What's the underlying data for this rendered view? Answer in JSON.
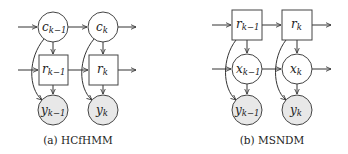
{
  "figures": [
    {
      "id": "a",
      "caption": "(a) HCfHMM",
      "nodes": [
        {
          "id": "c_km1",
          "shape": "circle",
          "var": "c",
          "sub": "k−1",
          "fill": "#ffffff"
        },
        {
          "id": "c_k",
          "shape": "circle",
          "var": "c",
          "sub": "k",
          "fill": "#ffffff"
        },
        {
          "id": "r_km1",
          "shape": "square",
          "var": "r",
          "sub": "k−1",
          "fill": "#ffffff"
        },
        {
          "id": "r_k",
          "shape": "square",
          "var": "r",
          "sub": "k",
          "fill": "#ffffff"
        },
        {
          "id": "y_km1",
          "shape": "circle",
          "var": "y",
          "sub": "k−1",
          "fill": "#e8e8e8",
          "observed": true
        },
        {
          "id": "y_k",
          "shape": "circle",
          "var": "y",
          "sub": "k",
          "fill": "#e8e8e8",
          "observed": true
        }
      ],
      "edges": [
        [
          "in",
          "c_km1"
        ],
        [
          "c_km1",
          "c_k"
        ],
        [
          "c_k",
          "out"
        ],
        [
          "in",
          "r_km1"
        ],
        [
          "r_km1",
          "r_k"
        ],
        [
          "r_k",
          "out"
        ],
        [
          "c_km1",
          "r_km1"
        ],
        [
          "c_k",
          "r_k"
        ],
        [
          "r_km1",
          "y_km1"
        ],
        [
          "r_k",
          "y_k"
        ],
        [
          "c_km1",
          "y_km1"
        ],
        [
          "c_k",
          "y_k"
        ]
      ]
    },
    {
      "id": "b",
      "caption": "(b) MSNDM",
      "nodes": [
        {
          "id": "r_km1",
          "shape": "square",
          "var": "r",
          "sub": "k−1",
          "fill": "#ffffff"
        },
        {
          "id": "r_k",
          "shape": "square",
          "var": "r",
          "sub": "k",
          "fill": "#ffffff"
        },
        {
          "id": "x_km1",
          "shape": "circle",
          "var": "x",
          "sub": "k−1",
          "fill": "#ffffff"
        },
        {
          "id": "x_k",
          "shape": "circle",
          "var": "x",
          "sub": "k",
          "fill": "#ffffff"
        },
        {
          "id": "y_km1",
          "shape": "circle",
          "var": "y",
          "sub": "k−1",
          "fill": "#e8e8e8",
          "observed": true
        },
        {
          "id": "y_k",
          "shape": "circle",
          "var": "y",
          "sub": "k",
          "fill": "#e8e8e8",
          "observed": true
        }
      ],
      "edges": [
        [
          "in",
          "r_km1"
        ],
        [
          "r_km1",
          "r_k"
        ],
        [
          "r_k",
          "out"
        ],
        [
          "in",
          "x_km1"
        ],
        [
          "x_km1",
          "x_k"
        ],
        [
          "x_k",
          "out"
        ],
        [
          "r_km1",
          "x_km1"
        ],
        [
          "r_k",
          "x_k"
        ],
        [
          "x_km1",
          "y_km1"
        ],
        [
          "x_k",
          "y_k"
        ],
        [
          "r_km1",
          "y_km1"
        ],
        [
          "r_k",
          "y_k"
        ]
      ]
    }
  ],
  "labels": {
    "a": {
      "c_km1_var": "c",
      "c_km1_sub": "k−1",
      "c_k_var": "c",
      "c_k_sub": "k",
      "r_km1_var": "r",
      "r_km1_sub": "k−1",
      "r_k_var": "r",
      "r_k_sub": "k",
      "y_km1_var": "y",
      "y_km1_sub": "k−1",
      "y_k_var": "y",
      "y_k_sub": "k",
      "caption": "(a) HCfHMM"
    },
    "b": {
      "r_km1_var": "r",
      "r_km1_sub": "k−1",
      "r_k_var": "r",
      "r_k_sub": "k",
      "x_km1_var": "x",
      "x_km1_sub": "k−1",
      "x_k_var": "x",
      "x_k_sub": "k",
      "y_km1_var": "y",
      "y_km1_sub": "k−1",
      "y_k_var": "y",
      "y_k_sub": "k",
      "caption": "(b) MSNDM"
    }
  },
  "colors": {
    "observed_fill": "#e8e8e8",
    "hidden_fill": "#ffffff",
    "stroke": "#444444"
  }
}
